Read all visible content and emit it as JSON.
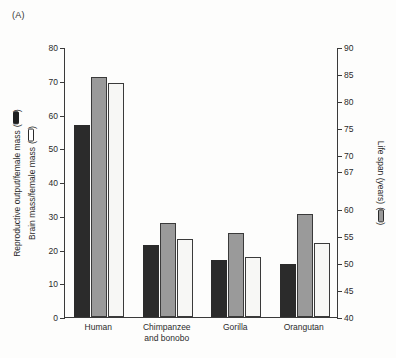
{
  "figure": {
    "panel_label": "(A)"
  },
  "axes": {
    "left": {
      "title_line1": "Reproductive output/female mass",
      "title_line2": "Brain mass/female mass",
      "glyph_line1": "solid-bar-icon",
      "glyph_line2": "hollow-bar-icon",
      "ticks": [
        "0",
        "10",
        "20",
        "30",
        "40",
        "50",
        "60",
        "70",
        "80"
      ],
      "min": 0,
      "max": 80
    },
    "right": {
      "title": "Life span (years)",
      "glyph": "shaded-bar-icon",
      "ticks": [
        "40",
        "45",
        "50",
        "55",
        "60",
        "67",
        "70",
        "75",
        "80",
        "85",
        "90"
      ],
      "min": 40,
      "max": 90
    },
    "x": {
      "categories": [
        "Human",
        "Chimpanzee\nand bonobo",
        "Gorilla",
        "Orangutan"
      ]
    }
  },
  "chart_data": {
    "type": "bar",
    "title": "(A)",
    "xlabel": "",
    "ylabel": "Reproductive output/female mass; Brain mass/female mass",
    "ylabel_secondary": "Life span (years)",
    "ylim": [
      0,
      80
    ],
    "ylim_secondary": [
      40,
      90
    ],
    "grid": false,
    "legend": "axis-labels-with-bar-glyphs",
    "categories": [
      "Human",
      "Chimpanzee and bonobo",
      "Gorilla",
      "Orangutan"
    ],
    "series": [
      {
        "name": "Reproductive output/female mass",
        "axis": "left",
        "style": "black-filled",
        "color": "#2b2b2b",
        "values": [
          56.8,
          21.3,
          17.0,
          15.7
        ]
      },
      {
        "name": "Life span (years)",
        "axis": "right",
        "style": "gray-filled",
        "color": "#9a9a9a",
        "values": [
          84.5,
          57.5,
          55.6,
          59.1
        ]
      },
      {
        "name": "Brain mass/female mass",
        "axis": "left",
        "style": "white-outlined",
        "color": "#f7f7f5",
        "values": [
          69.3,
          23.2,
          17.7,
          21.9
        ]
      }
    ]
  }
}
